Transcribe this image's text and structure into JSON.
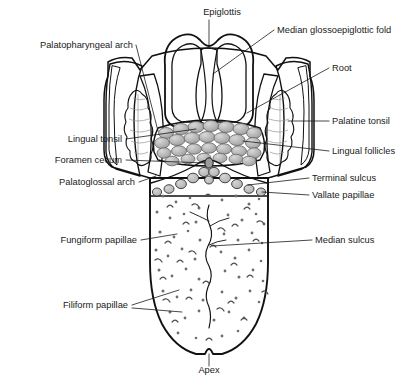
{
  "figure": {
    "background": "#ffffff"
  },
  "palette": {
    "outline": "#111111",
    "text": "#1a1a1a",
    "tongue_body_light": "#cfcfcf",
    "tongue_body_mid": "#c2c2c2",
    "root_gray": "#a9a9a9",
    "arch_gray": "#b4b4b4",
    "arch_dark": "#9a9a9a",
    "epiglottis_gray": "#b0b0b0",
    "epiglottis_light": "#c9c9c9",
    "tonsil_light": "#e2e2e2",
    "follicle_gray": "#b8b8b8",
    "papilla_gray": "#bdbdbd",
    "papilla_dot": "#6e6e6e"
  },
  "labels": [
    {
      "id": "epiglottis",
      "text": "Epiglottis",
      "side": "center",
      "tx": 222,
      "ty": 15,
      "anchor": "middle"
    },
    {
      "id": "median-gef",
      "text": "Median glossoepiglottic fold",
      "side": "right",
      "tx": 277,
      "ty": 33,
      "anchor": "start"
    },
    {
      "id": "palatopharyngeal",
      "text": "Palatopharyngeal arch",
      "side": "left",
      "tx": 133,
      "ty": 48,
      "anchor": "end"
    },
    {
      "id": "root",
      "text": "Root",
      "side": "right",
      "tx": 332,
      "ty": 71,
      "anchor": "start"
    },
    {
      "id": "palatine-tonsil",
      "text": "Palatine tonsil",
      "side": "right",
      "tx": 332,
      "ty": 124,
      "anchor": "start"
    },
    {
      "id": "lingual-tonsil",
      "text": "Lingual tonsil",
      "side": "left",
      "tx": 122,
      "ty": 142,
      "anchor": "end"
    },
    {
      "id": "lingual-follicles",
      "text": "Lingual follicles",
      "side": "right",
      "tx": 332,
      "ty": 154,
      "anchor": "start"
    },
    {
      "id": "foramen-cecum",
      "text": "Foramen cecum",
      "side": "left",
      "tx": 122,
      "ty": 163,
      "anchor": "end"
    },
    {
      "id": "terminal-sulcus",
      "text": "Terminal sulcus",
      "side": "right",
      "tx": 312,
      "ty": 181,
      "anchor": "start"
    },
    {
      "id": "palatoglossal",
      "text": "Palatoglossal arch",
      "side": "left",
      "tx": 135,
      "ty": 185,
      "anchor": "end"
    },
    {
      "id": "vallate-papillae",
      "text": "Vallate papillae",
      "side": "right",
      "tx": 312,
      "ty": 198,
      "anchor": "start"
    },
    {
      "id": "fungiform",
      "text": "Fungiform papillae",
      "side": "left",
      "tx": 137,
      "ty": 243,
      "anchor": "end"
    },
    {
      "id": "median-sulcus",
      "text": "Median sulcus",
      "side": "right",
      "tx": 315,
      "ty": 243,
      "anchor": "start"
    },
    {
      "id": "filiform",
      "text": "Filiform papillae",
      "side": "left",
      "tx": 128,
      "ty": 308,
      "anchor": "end"
    },
    {
      "id": "apex",
      "text": "Apex",
      "side": "center",
      "tx": 209,
      "ty": 373,
      "anchor": "middle"
    }
  ],
  "structures": [
    {
      "id": "epiglottis",
      "name": "Epiglottis"
    },
    {
      "id": "median-glossoepiglottic-fold",
      "name": "Median glossoepiglottic fold"
    },
    {
      "id": "palatopharyngeal-arch",
      "name": "Palatopharyngeal arch"
    },
    {
      "id": "palatoglossal-arch",
      "name": "Palatoglossal arch"
    },
    {
      "id": "palatine-tonsil",
      "name": "Palatine tonsil"
    },
    {
      "id": "lingual-tonsil",
      "name": "Lingual tonsil"
    },
    {
      "id": "lingual-follicles",
      "name": "Lingual follicles"
    },
    {
      "id": "foramen-cecum",
      "name": "Foramen cecum"
    },
    {
      "id": "terminal-sulcus",
      "name": "Terminal sulcus"
    },
    {
      "id": "vallate-papillae",
      "name": "Vallate papillae"
    },
    {
      "id": "fungiform-papillae",
      "name": "Fungiform papillae"
    },
    {
      "id": "filiform-papillae",
      "name": "Filiform papillae"
    },
    {
      "id": "median-sulcus",
      "name": "Median sulcus"
    },
    {
      "id": "root",
      "name": "Root of tongue"
    },
    {
      "id": "apex",
      "name": "Apex of tongue"
    },
    {
      "id": "tongue-body",
      "name": "Body of tongue"
    }
  ]
}
